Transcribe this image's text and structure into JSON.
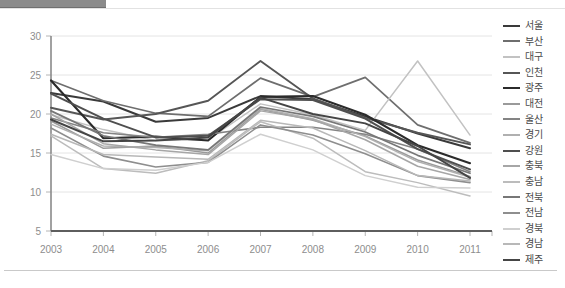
{
  "page": {
    "background_color": "#ffffff",
    "top_bar_color": "#8b8b8b"
  },
  "chart_data": {
    "type": "line",
    "title": "",
    "subtitle": "",
    "xlabel": "",
    "ylabel": "",
    "x": [
      2003,
      2004,
      2005,
      2006,
      2007,
      2008,
      2009,
      2010,
      2011
    ],
    "categories": [
      "2003",
      "2004",
      "2005",
      "2006",
      "2007",
      "2008",
      "2009",
      "2010",
      "2011"
    ],
    "xtick_labels": [
      "2003",
      "2004",
      "2005",
      "2006",
      "2007",
      "2008",
      "2009",
      "2010",
      "2011"
    ],
    "ytick_labels": [
      "5",
      "10",
      "15",
      "20",
      "25",
      "30"
    ],
    "yticks": [
      5,
      10,
      15,
      20,
      25,
      30
    ],
    "ylim": [
      5,
      30
    ],
    "grid": "horizontal",
    "legend_position": "right",
    "series": [
      {
        "name": "서울",
        "color": "#3a3a3a",
        "width": 2.0,
        "values": [
          22.7,
          21.6,
          19.0,
          19.5,
          22.3,
          21.9,
          19.7,
          17.5,
          15.6
        ]
      },
      {
        "name": "부산",
        "color": "#6e6e6e",
        "width": 1.7,
        "values": [
          24.3,
          21.7,
          20.1,
          19.7,
          24.6,
          22.2,
          24.7,
          18.6,
          16.3
        ]
      },
      {
        "name": "대구",
        "color": "#c2c2c2",
        "width": 1.5,
        "values": [
          19.9,
          18.0,
          16.6,
          16.7,
          21.3,
          19.9,
          17.9,
          26.8,
          17.3
        ]
      },
      {
        "name": "인천",
        "color": "#565656",
        "width": 1.9,
        "values": [
          20.8,
          19.3,
          20.0,
          21.7,
          26.8,
          22.0,
          19.5,
          17.6,
          16.1
        ]
      },
      {
        "name": "광주",
        "color": "#2b2b2b",
        "width": 2.1,
        "values": [
          24.3,
          16.9,
          17.1,
          16.6,
          22.2,
          22.3,
          19.9,
          16.0,
          13.7
        ]
      },
      {
        "name": "대전",
        "color": "#9a9a9a",
        "width": 1.5,
        "values": [
          19.1,
          15.6,
          15.9,
          15.0,
          20.6,
          19.2,
          17.2,
          14.1,
          12.0
        ]
      },
      {
        "name": "울산",
        "color": "#848484",
        "width": 1.6,
        "values": [
          19.5,
          17.6,
          17.0,
          17.4,
          18.3,
          18.3,
          17.4,
          15.5,
          12.6
        ]
      },
      {
        "name": "경기",
        "color": "#b0b0b0",
        "width": 1.5,
        "values": [
          18.7,
          15.9,
          15.7,
          15.3,
          20.7,
          19.4,
          17.1,
          13.9,
          11.9
        ]
      },
      {
        "name": "강원",
        "color": "#4f4f4f",
        "width": 2.0,
        "values": [
          22.6,
          19.4,
          17.0,
          17.2,
          21.9,
          21.8,
          19.4,
          15.5,
          12.9
        ]
      },
      {
        "name": "충북",
        "color": "#a6a6a6",
        "width": 1.5,
        "values": [
          20.0,
          16.2,
          15.4,
          14.8,
          20.4,
          19.3,
          16.7,
          13.3,
          11.6
        ]
      },
      {
        "name": "충남",
        "color": "#bcbcbc",
        "width": 1.5,
        "values": [
          17.2,
          13.0,
          12.4,
          14.0,
          19.0,
          16.9,
          12.6,
          11.2,
          9.5
        ]
      },
      {
        "name": "전북",
        "color": "#777777",
        "width": 1.7,
        "values": [
          20.4,
          17.2,
          16.0,
          15.4,
          20.9,
          19.7,
          17.7,
          14.7,
          12.4
        ]
      },
      {
        "name": "전남",
        "color": "#8e8e8e",
        "width": 1.6,
        "values": [
          18.2,
          14.6,
          13.2,
          13.8,
          18.6,
          17.3,
          14.9,
          12.1,
          11.2
        ]
      },
      {
        "name": "경북",
        "color": "#cfcfcf",
        "width": 1.5,
        "values": [
          14.8,
          13.0,
          12.8,
          13.8,
          17.4,
          15.4,
          12.1,
          10.6,
          10.5
        ]
      },
      {
        "name": "경남",
        "color": "#b8b8b8",
        "width": 1.5,
        "values": [
          17.4,
          14.8,
          14.5,
          14.2,
          19.2,
          18.2,
          15.3,
          12.1,
          11.4
        ]
      },
      {
        "name": "제주",
        "color": "#454545",
        "width": 2.0,
        "values": [
          19.3,
          16.5,
          16.6,
          17.0,
          22.1,
          20.0,
          18.8,
          15.9,
          11.8
        ]
      }
    ]
  },
  "legend": {
    "items": [
      {
        "label": "서울"
      },
      {
        "label": "부산"
      },
      {
        "label": "대구"
      },
      {
        "label": "인천"
      },
      {
        "label": "광주"
      },
      {
        "label": "대전"
      },
      {
        "label": "울산"
      },
      {
        "label": "경기"
      },
      {
        "label": "강원"
      },
      {
        "label": "충북"
      },
      {
        "label": "충남"
      },
      {
        "label": "전북"
      },
      {
        "label": "전남"
      },
      {
        "label": "경북"
      },
      {
        "label": "경남"
      },
      {
        "label": "제주"
      }
    ]
  }
}
